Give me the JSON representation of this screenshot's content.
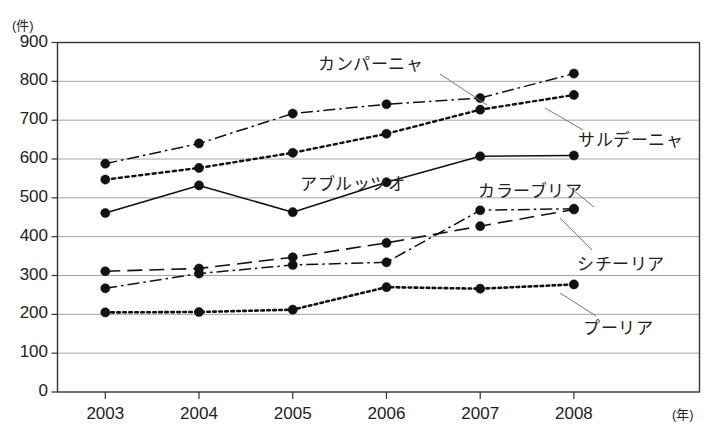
{
  "chart_data": {
    "type": "line",
    "title": "",
    "xlabel": "年",
    "ylabel": "(件)",
    "ylim": [
      0,
      900
    ],
    "ytick_step": 100,
    "grid": true,
    "legend_position": "inline-annotations",
    "categories": [
      "2003",
      "2004",
      "2005",
      "2006",
      "2007",
      "2008"
    ],
    "yticks": [
      "900",
      "800",
      "700",
      "600",
      "500",
      "400",
      "300",
      "200",
      "100",
      "0"
    ],
    "series": [
      {
        "name": "カンパーニャ",
        "style": "dash-dot",
        "values": [
          588,
          640,
          717,
          741,
          757,
          820
        ]
      },
      {
        "name": "サルデーニャ",
        "style": "dotted",
        "values": [
          547,
          577,
          616,
          665,
          727,
          765
        ]
      },
      {
        "name": "アブルッツオ",
        "style": "solid",
        "values": [
          461,
          532,
          463,
          540,
          607,
          609
        ]
      },
      {
        "name": "シチーリア",
        "style": "long-dash",
        "values": [
          311,
          318,
          347,
          384,
          427,
          470
        ]
      },
      {
        "name": "カラーブリア",
        "style": "dash-dot",
        "values": [
          267,
          305,
          327,
          334,
          468,
          472
        ]
      },
      {
        "name": "プーリア",
        "style": "dotted-fine",
        "values": [
          205,
          206,
          212,
          270,
          266,
          277
        ]
      }
    ]
  },
  "annotations": {
    "campania": {
      "label": "カンパーニャ",
      "x": 318,
      "y": 50
    },
    "sardegna": {
      "label": "サルデーニャ",
      "x": 578,
      "y": 126
    },
    "abruzzo": {
      "label": "アブルッツオ",
      "x": 300,
      "y": 170
    },
    "calabria": {
      "label": "カラーブリア",
      "x": 478,
      "y": 177
    },
    "sicilia": {
      "label": "シチーリア",
      "x": 577,
      "y": 250
    },
    "puglia": {
      "label": "プーリア",
      "x": 583,
      "y": 314
    }
  },
  "colors": {
    "line": "#111111",
    "grid": "#9a9a9a",
    "axis": "#333333",
    "text": "#222222",
    "leader": "#777777"
  }
}
